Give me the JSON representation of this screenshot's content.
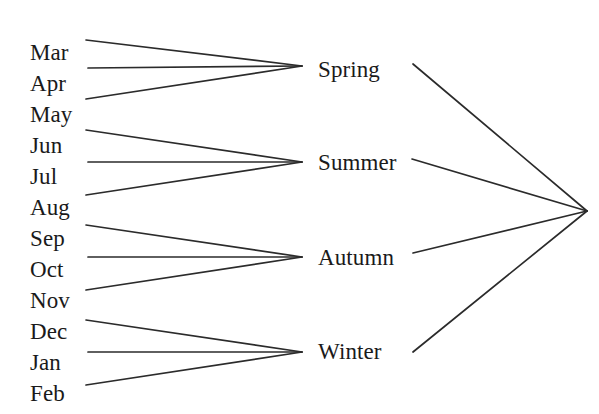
{
  "diagram": {
    "type": "hierarchical-tree",
    "orientation": "left-to-right-converging",
    "background_color": "#ffffff",
    "line_color": "#2b2b2b",
    "text_color": "#1a1a1a",
    "root": {
      "label": "",
      "x": 587,
      "y": 211
    },
    "levels": [
      {
        "name": "months",
        "nodes": [
          {
            "label": "Mar",
            "x": 30,
            "y": 41,
            "edge_x": 86,
            "edge_y": 40,
            "parent": "Spring"
          },
          {
            "label": "Apr",
            "x": 30,
            "y": 72,
            "edge_x": 88,
            "edge_y": 68,
            "parent": "Spring"
          },
          {
            "label": "May",
            "x": 30,
            "y": 103,
            "edge_x": 86,
            "edge_y": 99,
            "parent": "Spring"
          },
          {
            "label": "Jun",
            "x": 30,
            "y": 134,
            "edge_x": 86,
            "edge_y": 130,
            "parent": "Summer"
          },
          {
            "label": "Jul",
            "x": 30,
            "y": 165,
            "edge_x": 88,
            "edge_y": 162,
            "parent": "Summer"
          },
          {
            "label": "Aug",
            "x": 30,
            "y": 196,
            "edge_x": 86,
            "edge_y": 195,
            "parent": "Summer"
          },
          {
            "label": "Sep",
            "x": 30,
            "y": 227,
            "edge_x": 86,
            "edge_y": 225,
            "parent": "Autumn"
          },
          {
            "label": "Oct",
            "x": 30,
            "y": 258,
            "edge_x": 88,
            "edge_y": 257,
            "parent": "Autumn"
          },
          {
            "label": "Nov",
            "x": 30,
            "y": 289,
            "edge_x": 86,
            "edge_y": 290,
            "parent": "Autumn"
          },
          {
            "label": "Dec",
            "x": 30,
            "y": 320,
            "edge_x": 86,
            "edge_y": 320,
            "parent": "Winter"
          },
          {
            "label": "Jan",
            "x": 30,
            "y": 351,
            "edge_x": 88,
            "edge_y": 352,
            "parent": "Winter"
          },
          {
            "label": "Feb",
            "x": 30,
            "y": 382,
            "edge_x": 86,
            "edge_y": 385,
            "parent": "Winter"
          }
        ]
      },
      {
        "name": "seasons",
        "nodes": [
          {
            "label": "Spring",
            "x": 318,
            "y": 58,
            "join_x": 302,
            "join_y": 66,
            "edge_x": 413,
            "edge_y": 64,
            "children": [
              "Mar",
              "Apr",
              "May"
            ]
          },
          {
            "label": "Summer",
            "x": 318,
            "y": 151,
            "join_x": 302,
            "join_y": 162,
            "edge_x": 412,
            "edge_y": 159,
            "children": [
              "Jun",
              "Jul",
              "Aug"
            ]
          },
          {
            "label": "Autumn",
            "x": 318,
            "y": 246,
            "join_x": 302,
            "join_y": 257,
            "edge_x": 413,
            "edge_y": 253,
            "children": [
              "Sep",
              "Oct",
              "Nov"
            ]
          },
          {
            "label": "Winter",
            "x": 318,
            "y": 340,
            "join_x": 302,
            "join_y": 352,
            "edge_x": 413,
            "edge_y": 352,
            "children": [
              "Dec",
              "Jan",
              "Feb"
            ]
          }
        ]
      }
    ]
  }
}
